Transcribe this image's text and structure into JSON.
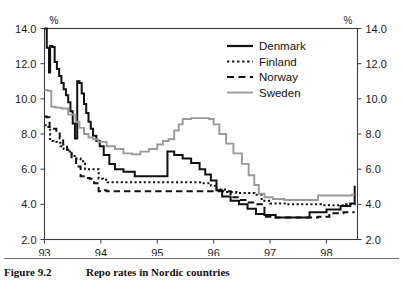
{
  "caption": {
    "figure_number": "Figure 9.2",
    "title": "Repo rates in Nordic countries"
  },
  "axes": {
    "left_unit_label": "%",
    "right_unit_label": "%",
    "y_ticks": [
      "14.0",
      "12.0",
      "10.0",
      "8.0",
      "6.0",
      "4.0",
      "2.0"
    ],
    "x_ticks": [
      "93",
      "94",
      "95",
      "96",
      "97",
      "98"
    ]
  },
  "legend": {
    "items": [
      {
        "label": "Denmark",
        "style": "solid",
        "color": "#111111"
      },
      {
        "label": "Finland",
        "style": "dotted",
        "color": "#111111"
      },
      {
        "label": "Norway",
        "style": "dashed",
        "color": "#111111"
      },
      {
        "label": "Sweden",
        "style": "solid",
        "color": "#9a9a9a"
      }
    ]
  },
  "chart_data": {
    "type": "line",
    "title": "Repo rates in Nordic countries",
    "xlabel": "",
    "ylabel": "%",
    "xlim": [
      93.0,
      98.55
    ],
    "ylim": [
      2.0,
      14.0
    ],
    "y_unit": "%",
    "grid": false,
    "legend_position": "top-right",
    "step_interpolation": "stepped",
    "x_tick_values": [
      93,
      94,
      95,
      96,
      97,
      98
    ],
    "y_tick_values": [
      2.0,
      4.0,
      6.0,
      8.0,
      10.0,
      12.0,
      14.0
    ],
    "dual_y_axis": true,
    "series": [
      {
        "name": "Denmark",
        "style": "solid",
        "color": "#111111",
        "x": [
          93.0,
          93.04,
          93.08,
          93.1,
          93.14,
          93.18,
          93.22,
          93.26,
          93.3,
          93.34,
          93.38,
          93.42,
          93.46,
          93.5,
          93.54,
          93.58,
          93.62,
          93.66,
          93.7,
          93.74,
          93.78,
          93.82,
          93.86,
          93.92,
          93.98,
          94.05,
          94.15,
          94.25,
          94.4,
          94.6,
          94.9,
          95.15,
          95.18,
          95.3,
          95.45,
          95.6,
          95.75,
          95.85,
          95.95,
          96.05,
          96.15,
          96.3,
          96.45,
          96.6,
          96.75,
          96.9,
          97.1,
          97.4,
          97.7,
          98.0,
          98.25,
          98.42,
          98.5
        ],
        "y": [
          14.0,
          12.9,
          11.5,
          13.0,
          12.95,
          12.1,
          11.7,
          11.3,
          10.9,
          10.55,
          10.2,
          9.8,
          9.3,
          8.6,
          7.75,
          11.0,
          10.9,
          10.3,
          9.7,
          9.2,
          8.7,
          8.3,
          7.9,
          7.6,
          7.3,
          6.8,
          6.3,
          6.0,
          5.85,
          5.6,
          5.6,
          5.6,
          7.0,
          6.8,
          6.6,
          6.35,
          6.0,
          5.7,
          5.35,
          4.8,
          4.45,
          4.2,
          4.0,
          3.75,
          3.45,
          3.4,
          3.25,
          3.25,
          3.55,
          3.7,
          3.9,
          4.05,
          5.05
        ]
      },
      {
        "name": "Finland",
        "style": "dotted",
        "color": "#111111",
        "x": [
          93.0,
          93.05,
          93.1,
          93.16,
          93.22,
          93.28,
          93.34,
          93.4,
          93.48,
          93.56,
          93.64,
          93.72,
          93.8,
          93.88,
          93.96,
          94.04,
          94.12,
          94.25,
          94.5,
          95.0,
          95.5,
          95.8,
          95.95,
          96.05,
          96.2,
          96.4,
          96.6,
          96.72,
          96.85,
          97.0,
          97.3,
          97.6,
          97.9,
          98.1,
          98.35,
          98.5
        ],
        "y": [
          8.5,
          8.4,
          7.6,
          7.55,
          7.5,
          7.3,
          7.15,
          7.0,
          6.75,
          6.6,
          6.45,
          6.0,
          6.0,
          6.0,
          5.45,
          5.4,
          5.25,
          5.25,
          5.25,
          5.25,
          5.25,
          5.2,
          5.05,
          4.85,
          4.7,
          4.65,
          4.65,
          4.55,
          4.2,
          4.05,
          4.0,
          4.0,
          3.95,
          3.95,
          4.0,
          4.05
        ]
      },
      {
        "name": "Norway",
        "style": "dashed",
        "color": "#111111",
        "x": [
          93.0,
          93.04,
          93.09,
          93.15,
          93.21,
          93.27,
          93.33,
          93.4,
          93.48,
          93.56,
          93.64,
          93.72,
          93.8,
          93.88,
          93.96,
          94.04,
          94.1,
          94.3,
          94.7,
          95.2,
          95.7,
          96.0,
          96.1,
          96.18,
          96.3,
          96.45,
          96.6,
          96.75,
          96.9,
          97.05,
          97.3,
          97.6,
          97.85,
          98.05,
          98.3,
          98.5
        ],
        "y": [
          9.0,
          8.95,
          8.4,
          8.3,
          8.1,
          7.75,
          7.4,
          7.1,
          6.6,
          6.15,
          5.6,
          5.5,
          5.45,
          5.2,
          4.75,
          4.8,
          4.75,
          4.75,
          4.75,
          4.75,
          4.75,
          4.75,
          4.75,
          4.75,
          4.4,
          4.25,
          4.1,
          4.0,
          3.3,
          3.25,
          3.25,
          3.25,
          3.3,
          3.5,
          3.55,
          3.55
        ]
      },
      {
        "name": "Sweden",
        "style": "solid",
        "color": "#9a9a9a",
        "x": [
          93.0,
          93.06,
          93.12,
          93.2,
          93.3,
          93.42,
          93.55,
          93.62,
          93.7,
          93.78,
          93.86,
          93.95,
          94.1,
          94.25,
          94.4,
          94.55,
          94.7,
          94.85,
          95.0,
          95.1,
          95.2,
          95.3,
          95.38,
          95.45,
          95.6,
          95.8,
          95.92,
          96.0,
          96.1,
          96.22,
          96.35,
          96.5,
          96.62,
          96.72,
          96.8,
          96.9,
          97.05,
          97.25,
          97.55,
          97.85,
          98.05,
          98.25,
          98.45,
          98.5
        ],
        "y": [
          10.5,
          10.45,
          9.55,
          9.5,
          9.45,
          9.1,
          8.7,
          8.35,
          8.0,
          7.8,
          7.7,
          7.55,
          7.3,
          7.15,
          6.9,
          6.85,
          7.0,
          7.15,
          7.4,
          7.6,
          7.7,
          8.2,
          8.55,
          8.85,
          8.9,
          8.9,
          8.85,
          8.55,
          8.0,
          7.45,
          6.9,
          6.3,
          5.65,
          5.1,
          4.6,
          4.4,
          4.3,
          4.25,
          4.25,
          4.5,
          4.5,
          4.5,
          4.55,
          4.55
        ]
      }
    ]
  }
}
